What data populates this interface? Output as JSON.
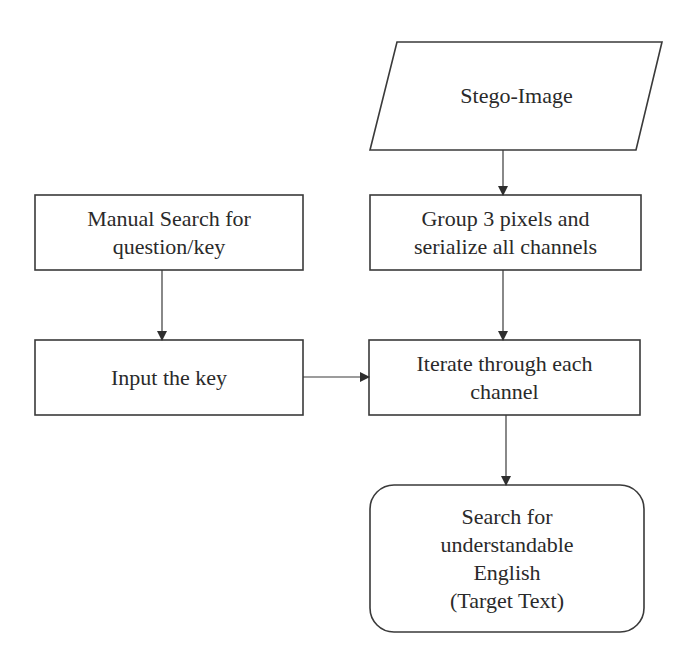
{
  "diagram": {
    "type": "flowchart",
    "stroke_color": "#3a3a3a",
    "text_color": "#2a2a2a",
    "background": "#ffffff",
    "nodes": {
      "stego_image": {
        "shape": "parallelogram",
        "lines": [
          "Stego-Image"
        ]
      },
      "group_pixels": {
        "shape": "rectangle",
        "lines": [
          "Group 3 pixels and",
          "serialize all channels"
        ]
      },
      "manual_search": {
        "shape": "rectangle",
        "lines": [
          "Manual Search for",
          "question/key"
        ]
      },
      "input_key": {
        "shape": "rectangle",
        "lines": [
          "Input the key"
        ]
      },
      "iterate_channels": {
        "shape": "rectangle",
        "lines": [
          "Iterate through each",
          "channel"
        ]
      },
      "search_english": {
        "shape": "rounded-rectangle",
        "lines": [
          "Search for",
          "understandable",
          "English",
          "(Target Text)"
        ]
      }
    },
    "edges": [
      {
        "from": "stego_image",
        "to": "group_pixels"
      },
      {
        "from": "group_pixels",
        "to": "iterate_channels"
      },
      {
        "from": "manual_search",
        "to": "input_key"
      },
      {
        "from": "input_key",
        "to": "iterate_channels"
      },
      {
        "from": "iterate_channels",
        "to": "search_english"
      }
    ]
  }
}
